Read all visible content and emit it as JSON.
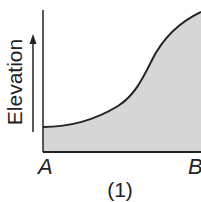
{
  "figure": {
    "caption": "(1)",
    "y_axis_label": "Elevation",
    "x_start_label": "A",
    "x_end_label": "B",
    "colors": {
      "fill": "#d6d6d6",
      "line": "#222222",
      "background": "#ffffff"
    }
  },
  "profile": {
    "description": "Elevation profile from A to B: low and flat near A, rising gently then steeply, leveling slightly toward B",
    "points_relative": [
      {
        "x": 0.0,
        "elevation": 0.18
      },
      {
        "x": 0.2,
        "elevation": 0.21
      },
      {
        "x": 0.4,
        "elevation": 0.32
      },
      {
        "x": 0.55,
        "elevation": 0.48
      },
      {
        "x": 0.7,
        "elevation": 0.66
      },
      {
        "x": 0.85,
        "elevation": 0.83
      },
      {
        "x": 1.0,
        "elevation": 0.96
      }
    ]
  }
}
